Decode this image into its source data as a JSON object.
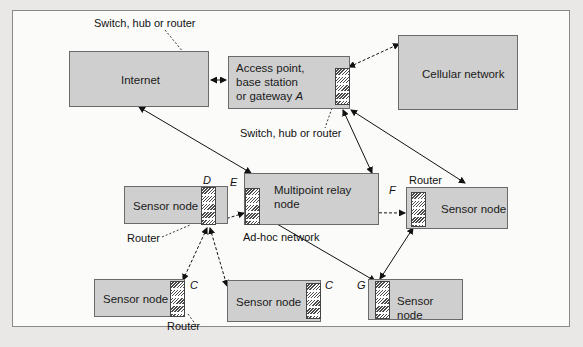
{
  "nodes": {
    "internet": "Internet",
    "access_point_line1": "Access point,",
    "access_point_line2": "base station",
    "access_point_line3": "or gateway ",
    "access_point_letter": "A",
    "cellular": "Cellular network",
    "relay": "Multipoint relay node",
    "sensor_d": "Sensor node",
    "sensor_f": "Sensor node",
    "sensor_c1": "Sensor node",
    "sensor_c2": "Sensor node",
    "sensor_g": "Sensor node"
  },
  "labels": {
    "switch_top": "Switch, hub or router",
    "switch_mid": "Switch, hub or router",
    "router_left": "Router",
    "router_right": "Router",
    "router_bottom": "Router",
    "adhoc": "Ad-hoc network",
    "letter_d": "D",
    "letter_e": "E",
    "letter_f": "F",
    "letter_c1": "C",
    "letter_c2": "C",
    "letter_g": "G"
  }
}
